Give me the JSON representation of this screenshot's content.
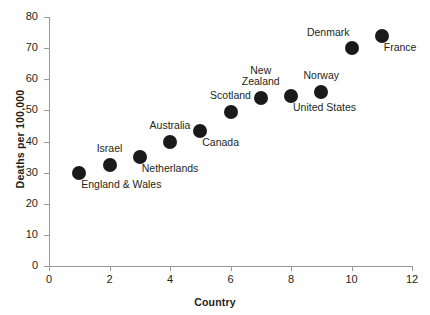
{
  "chart_data": {
    "type": "scatter",
    "title": "",
    "xlabel": "Country",
    "ylabel": "Deaths per 100,000",
    "xlim": [
      0,
      12
    ],
    "ylim": [
      0,
      80
    ],
    "grid": false,
    "legend": "none",
    "marker_color": "#1a1a1a",
    "axis_color": "#9a9a9a",
    "x_ticks": [
      "0",
      "2",
      "4",
      "6",
      "8",
      "10",
      "12"
    ],
    "x_tick_values": [
      0,
      2,
      4,
      6,
      8,
      10,
      12
    ],
    "y_ticks": [
      "0",
      "10",
      "20",
      "30",
      "40",
      "50",
      "60",
      "70",
      "80"
    ],
    "y_tick_values": [
      0,
      10,
      20,
      30,
      40,
      50,
      60,
      70,
      80
    ],
    "categories": [
      "England & Wales",
      "Israel",
      "Netherlands",
      "Australia",
      "Canada",
      "Scotland",
      "New Zealand",
      "United States",
      "Norway",
      "Denmark",
      "France"
    ],
    "x": [
      1,
      2,
      3,
      4,
      5,
      6,
      7,
      8,
      9,
      10,
      11
    ],
    "values": [
      30,
      32.5,
      35,
      40,
      43.5,
      49.5,
      54,
      54.5,
      56,
      70,
      74
    ],
    "points": [
      {
        "label": "England & Wales",
        "x": 1,
        "y": 30,
        "label_pos": "below-right"
      },
      {
        "label": "Israel",
        "x": 2,
        "y": 32.5,
        "label_pos": "above"
      },
      {
        "label": "Netherlands",
        "x": 3,
        "y": 35,
        "label_pos": "below-right"
      },
      {
        "label": "Australia",
        "x": 4,
        "y": 40,
        "label_pos": "above"
      },
      {
        "label": "Canada",
        "x": 5,
        "y": 43.5,
        "label_pos": "below-right"
      },
      {
        "label": "Scotland",
        "x": 6,
        "y": 49.5,
        "label_pos": "above"
      },
      {
        "label": "New\nZealand",
        "x": 7,
        "y": 54,
        "label_pos": "above"
      },
      {
        "label": "United States",
        "x": 8,
        "y": 54.5,
        "label_pos": "below-right"
      },
      {
        "label": "Norway",
        "x": 9,
        "y": 56,
        "label_pos": "above"
      },
      {
        "label": "Denmark",
        "x": 10,
        "y": 70,
        "label_pos": "above-left"
      },
      {
        "label": "France",
        "x": 11,
        "y": 74,
        "label_pos": "below-right"
      }
    ]
  },
  "axes": {
    "y_title": "Deaths per 100,000",
    "x_title": "Country"
  },
  "ticks": {
    "y": [
      "80",
      "70",
      "60",
      "50",
      "40",
      "30",
      "20",
      "10",
      "0"
    ],
    "x": [
      "0",
      "2",
      "4",
      "6",
      "8",
      "10",
      "12"
    ]
  },
  "point_labels": {
    "england_wales": "England & Wales",
    "israel": "Israel",
    "netherlands": "Netherlands",
    "australia": "Australia",
    "canada": "Canada",
    "scotland": "Scotland",
    "new_zealand": "New\nZealand",
    "united_states": "United States",
    "norway": "Norway",
    "denmark": "Denmark",
    "france": "France"
  }
}
